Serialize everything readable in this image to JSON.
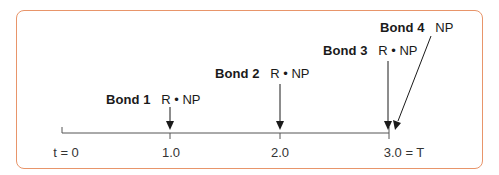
{
  "diagram": {
    "title": "",
    "frame_color": "#E8956A",
    "line_color": "#333333",
    "timeline": {
      "ticks": [
        {
          "label": "t = 0",
          "x": 62
        },
        {
          "label": "1.0",
          "x": 170
        },
        {
          "label": "2.0",
          "x": 280
        },
        {
          "label": "3.0 = T",
          "x": 389
        }
      ]
    },
    "bonds": [
      {
        "name": "Bond 1",
        "payment": "R • NP",
        "maturity": "1.0"
      },
      {
        "name": "Bond 2",
        "payment": "R • NP",
        "maturity": "2.0"
      },
      {
        "name": "Bond 3",
        "payment": "R • NP",
        "maturity": "3.0"
      },
      {
        "name": "Bond 4",
        "payment": "NP",
        "maturity": "3.0"
      }
    ]
  }
}
